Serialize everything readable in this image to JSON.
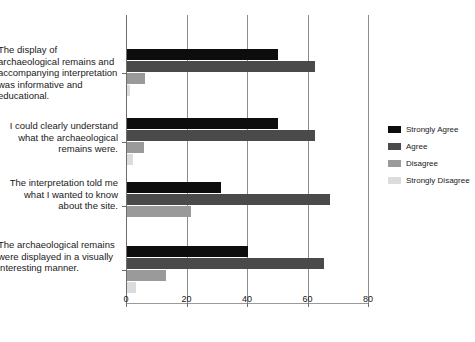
{
  "chart_data": {
    "type": "bar",
    "orientation": "horizontal",
    "title": "",
    "subtitle": "",
    "xlabel": "",
    "ylabel": "",
    "xlim": [
      0,
      80
    ],
    "xticks": [
      0,
      20,
      40,
      60,
      80
    ],
    "xtick_labels": [
      "0",
      "20",
      "40",
      "60",
      "80"
    ],
    "grid": "vertical",
    "legend_position": "right",
    "categories": [
      "The display of archaeological remains and accompanying interpretation was informative and educational.",
      "I could clearly understand what the archaeological remains were.",
      "The interpretation told me what I wanted to know about the site.",
      "The archaeological remains were displayed in a visually interesting manner."
    ],
    "series": [
      {
        "name": "Strongly Agree",
        "color": "#0d0d0d",
        "values": [
          50,
          50,
          31,
          40
        ]
      },
      {
        "name": "Agree",
        "color": "#4a4a4a",
        "values": [
          62,
          62,
          67,
          65
        ]
      },
      {
        "name": "Disagree",
        "color": "#9a9a9a",
        "values": [
          6,
          5.5,
          21,
          13
        ]
      },
      {
        "name": "Strongly Disagree",
        "color": "#dcdcdc",
        "values": [
          1,
          2,
          0,
          3
        ]
      }
    ]
  },
  "legend": {
    "items": [
      {
        "label": "Strongly Agree"
      },
      {
        "label": "Agree"
      },
      {
        "label": "Disagree"
      },
      {
        "label": "Strongly Disagree"
      }
    ]
  },
  "axis": {
    "x": {
      "ticks": [
        {
          "label": "0"
        },
        {
          "label": "20"
        },
        {
          "label": "40"
        },
        {
          "label": "60"
        },
        {
          "label": "80"
        }
      ]
    }
  },
  "categories_text": [
    "The display of archaeological remains and accompanying interpretation was informative and educational.",
    "I could clearly understand what the archaeological remains were.",
    "The interpretation told me what I wanted to know about the site.",
    "The archaeological remains were displayed in a visually interesting manner."
  ]
}
